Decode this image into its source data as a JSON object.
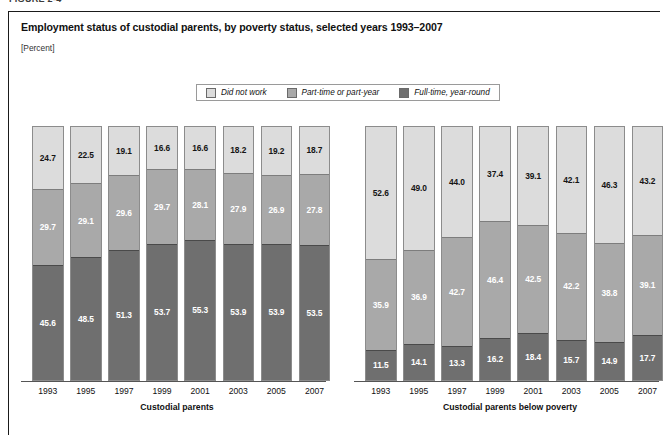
{
  "figure": {
    "number_label": "FIGURE 2-4"
  },
  "header": {
    "title": "Employment status of custodial parents, by poverty status, selected years 1993–2007",
    "subtitle": "[Percent]"
  },
  "legend": {
    "items": [
      {
        "label": "Did not work",
        "color": "#dcdcdc",
        "icon": "legend-swatch-icon"
      },
      {
        "label": "Part-time or part-year",
        "color": "#a9a9a9",
        "icon": "legend-swatch-icon"
      },
      {
        "label": "Full-time, year-round",
        "color": "#6f6f6f",
        "icon": "legend-swatch-icon"
      }
    ]
  },
  "panels": [
    {
      "id": "left",
      "caption": "Custodial parents"
    },
    {
      "id": "right",
      "caption": "Custodial parents below poverty"
    }
  ],
  "chart_data": [
    {
      "type": "bar",
      "subtype": "stacked-100-percent",
      "title": "Custodial parents",
      "xlabel": "",
      "ylabel": "",
      "ylim": [
        0,
        100
      ],
      "grid": false,
      "legend_position": "top-center",
      "categories": [
        "1993",
        "1995",
        "1997",
        "1999",
        "2001",
        "2003",
        "2005",
        "2007"
      ],
      "series": [
        {
          "name": "Full-time, year-round",
          "color": "#6f6f6f",
          "values": [
            45.6,
            48.5,
            51.3,
            53.7,
            55.3,
            53.9,
            53.9,
            53.5
          ]
        },
        {
          "name": "Part-time or part-year",
          "color": "#a9a9a9",
          "values": [
            29.7,
            29.1,
            29.6,
            29.7,
            28.1,
            27.9,
            26.9,
            27.8
          ]
        },
        {
          "name": "Did not work",
          "color": "#dcdcdc",
          "values": [
            24.7,
            22.5,
            19.1,
            16.6,
            16.6,
            18.2,
            19.2,
            18.7
          ]
        }
      ]
    },
    {
      "type": "bar",
      "subtype": "stacked-100-percent",
      "title": "Custodial parents below poverty",
      "xlabel": "",
      "ylabel": "",
      "ylim": [
        0,
        100
      ],
      "grid": false,
      "legend_position": "top-center",
      "categories": [
        "1993",
        "1995",
        "1997",
        "1999",
        "2001",
        "2003",
        "2005",
        "2007"
      ],
      "series": [
        {
          "name": "Full-time, year-round",
          "color": "#6f6f6f",
          "values": [
            11.5,
            14.1,
            13.3,
            16.2,
            18.4,
            15.7,
            14.9,
            17.7
          ]
        },
        {
          "name": "Part-time or part-year",
          "color": "#a9a9a9",
          "values": [
            35.9,
            36.9,
            42.7,
            46.4,
            42.5,
            42.2,
            38.8,
            39.1
          ]
        },
        {
          "name": "Did not work",
          "color": "#dcdcdc",
          "values": [
            52.6,
            49.0,
            44.0,
            37.4,
            39.1,
            42.1,
            46.3,
            43.2
          ]
        }
      ]
    }
  ]
}
